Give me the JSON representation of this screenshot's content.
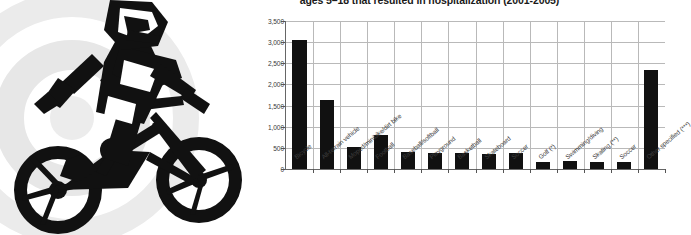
{
  "illustration": {
    "name": "bmx-cyclist-silhouette",
    "description": "Black silhouette of a youth riding a bicycle, over concentric light gray rings",
    "ring_color": "#e9e9e9",
    "silhouette_color": "#111111"
  },
  "chart_data": {
    "type": "bar",
    "title": "ages 5–18 that resulted in hospitalization (2001-2005)",
    "xlabel": "",
    "ylabel": "",
    "ylim": [
      0,
      3500
    ],
    "grid": true,
    "legend": false,
    "ytick_labels": [
      "0",
      "500",
      "1,000",
      "1,500",
      "2,000",
      "2,500",
      "3,000",
      "3,500"
    ],
    "ytick_values": [
      0,
      500,
      1000,
      1500,
      2000,
      2500,
      3000,
      3500
    ],
    "categories": [
      "Bicycle",
      "All-terrain vehicle",
      "Moped/minibike/dirt bike",
      "Football",
      "Baseball/softball",
      "Playground",
      "Basketball",
      "Skateboard",
      "Soccer",
      "Golf (*)",
      "Swimming/diving",
      "Skating (**)",
      "Soccer",
      "Other specified (***)"
    ],
    "values": [
      3050,
      1630,
      510,
      800,
      410,
      370,
      380,
      360,
      370,
      170,
      200,
      165,
      175,
      2350
    ],
    "bar_color": "#111111"
  }
}
